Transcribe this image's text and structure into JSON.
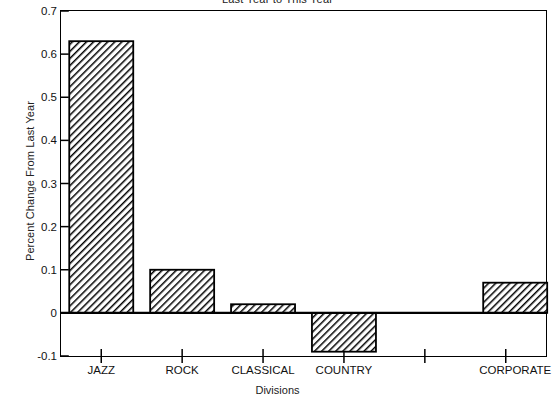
{
  "chart_data": {
    "type": "bar",
    "title": "Last Year to This Year",
    "xlabel": "Divisions",
    "ylabel": "Percent Change From Last Year",
    "categories": [
      "JAZZ",
      "ROCK",
      "CLASSICAL",
      "COUNTRY",
      "CORPORATE"
    ],
    "values": [
      0.63,
      0.1,
      0.02,
      -0.09,
      0.07
    ],
    "ylim": [
      -0.1,
      0.7
    ],
    "y_ticks": [
      0.7,
      0.6,
      0.5,
      0.4,
      0.3,
      0.2,
      0.1,
      0,
      -0.1
    ],
    "y_tick_labels": [
      "0.7",
      "0.6",
      "0.5",
      "0.4",
      "0.3",
      "0.2",
      "0.1",
      "0",
      "-0.1"
    ],
    "grid": false,
    "legend": null,
    "bar_style": {
      "fill": "#ffffff",
      "hatch": "/",
      "hatch_color": "#000000",
      "edge_color": "#000000"
    },
    "frame_color": "#000000",
    "background": "#ffffff",
    "note": "Last bar (CORPORATE) is clipped at the right plot border; title is clipped by the top image edge."
  },
  "axis": {
    "y_title": "Percent Change From Last Year",
    "x_title": "Divisions"
  },
  "title": {
    "text": "Last Year to This Year"
  }
}
